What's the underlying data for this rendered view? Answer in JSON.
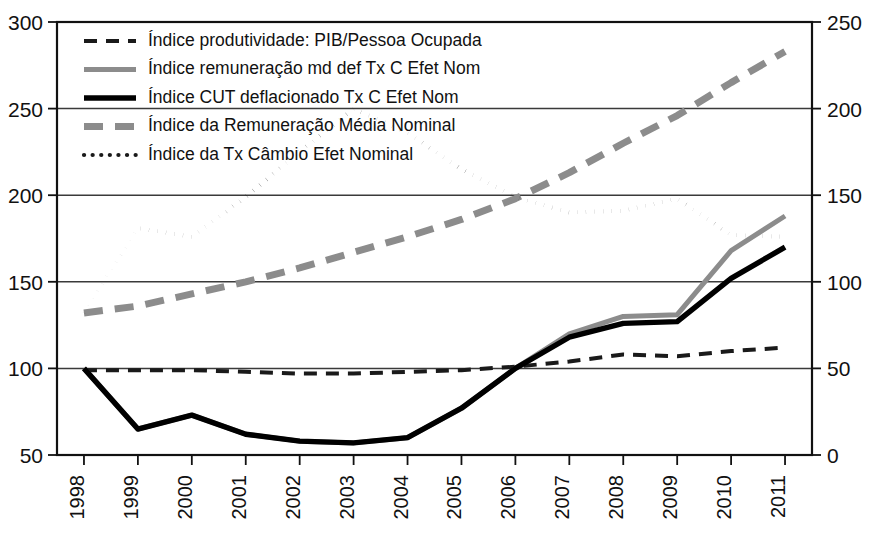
{
  "chart_data": {
    "type": "line",
    "title": "",
    "subtitle": "",
    "xlabel": "",
    "ylabel": "",
    "grid": true,
    "legend_position": "top-left",
    "categories": [
      "1998",
      "1999",
      "2000",
      "2001",
      "2002",
      "2003",
      "2004",
      "2005",
      "2006",
      "2007",
      "2008",
      "2009",
      "2010",
      "2011"
    ],
    "x": [
      1998,
      1999,
      2000,
      2001,
      2002,
      2003,
      2004,
      2005,
      2006,
      2007,
      2008,
      2009,
      2010,
      2011
    ],
    "left_axis": {
      "ylim": [
        50,
        300
      ],
      "ticks": [
        50,
        100,
        150,
        200,
        250,
        300
      ],
      "tick_labels": [
        "50",
        "100",
        "150",
        "200",
        "250",
        "300"
      ]
    },
    "right_axis": {
      "ylim": [
        0,
        250
      ],
      "ticks": [
        0,
        50,
        100,
        150,
        200,
        250,
        300
      ],
      "tick_labels": [
        "0",
        "50",
        "100",
        "150",
        "200",
        "250",
        "300"
      ]
    },
    "series": [
      {
        "name": "Índice produtividade: PIB/Pessoa Ocupada",
        "axis": "left",
        "style": "dashed",
        "color": "#1a1a1a",
        "width": 4.0,
        "dasharray": "13,9",
        "values": [
          99,
          99,
          99,
          98,
          97,
          97,
          98,
          99,
          101,
          104,
          108,
          107,
          110,
          112
        ]
      },
      {
        "name": "Índice remuneração md def Tx C Efet Nom",
        "axis": "left",
        "style": "solid",
        "color": "#8c8c8c",
        "width": 5.0,
        "dasharray": "",
        "values": [
          100,
          65,
          73,
          62,
          58,
          57,
          60,
          77,
          100,
          120,
          130,
          131,
          168,
          188
        ]
      },
      {
        "name": "Índice CUT deflacionado Tx C Efet Nom",
        "axis": "left",
        "style": "solid",
        "color": "#000000",
        "width": 5.4,
        "dasharray": "",
        "values": [
          100,
          65,
          73,
          62,
          58,
          57,
          60,
          77,
          100,
          118,
          126,
          127,
          152,
          170
        ]
      },
      {
        "name": "Índice da Remuneração Média Nominal",
        "axis": "left",
        "style": "dashed",
        "color": "#8c8c8c",
        "width": 7.0,
        "dasharray": "19,12",
        "values": [
          132,
          136,
          143,
          150,
          158,
          167,
          176,
          186,
          198,
          213,
          230,
          246,
          265,
          283
        ]
      },
      {
        "name": "Índice da Tx Câmbio Efet Nominal",
        "axis": "left",
        "style": "dotted",
        "color": "#1a1a1a",
        "width": 4.2,
        "dasharray": "0.1,8.5",
        "values": [
          132,
          181,
          176,
          199,
          225,
          250,
          236,
          215,
          199,
          190,
          191,
          198,
          177,
          176
        ]
      }
    ],
    "legend_entries": [
      {
        "label": "Índice produtividade: PIB/Pessoa Ocupada",
        "swatch": "black-dashed"
      },
      {
        "label": "Índice remuneração md def Tx C Efet Nom",
        "swatch": "gray-solid"
      },
      {
        "label": "Índice CUT deflacionado Tx C Efet Nom",
        "swatch": "black-solid"
      },
      {
        "label": "Índice da Remuneração Média Nominal",
        "swatch": "gray-dashed"
      },
      {
        "label": "Índice da Tx Câmbio Efet Nominal",
        "swatch": "black-dotted"
      }
    ]
  }
}
